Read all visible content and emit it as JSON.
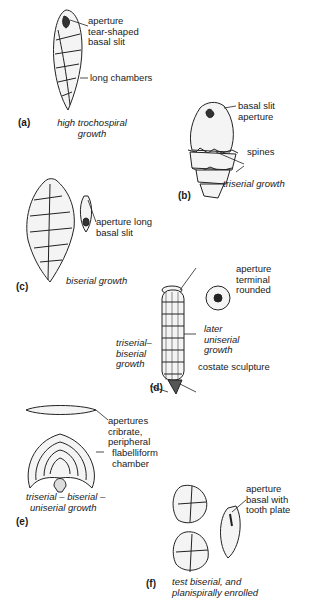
{
  "figure": {
    "panels": [
      {
        "id": "a",
        "tag": "(a)",
        "caption": [
          "high trochospiral",
          "growth"
        ],
        "labels": [
          [
            "aperture",
            "tear-shaped",
            "basal slit"
          ],
          [
            "long chambers"
          ]
        ]
      },
      {
        "id": "b",
        "tag": "(b)",
        "caption": [
          "triserial growth"
        ],
        "labels": [
          [
            "basal slit",
            "aperture"
          ],
          [
            "spines"
          ]
        ]
      },
      {
        "id": "c",
        "tag": "(c)",
        "caption": [
          "biserial growth"
        ],
        "labels": [
          [
            "aperture long",
            "basal slit"
          ]
        ]
      },
      {
        "id": "d",
        "tag": "(d)",
        "caption": [
          "triserial–",
          "biserial",
          "growth"
        ],
        "labels": [
          [
            "aperture",
            "terminal",
            "rounded"
          ],
          [
            "later",
            "uniserial",
            "growth"
          ],
          [
            "costate sculpture"
          ]
        ]
      },
      {
        "id": "e",
        "tag": "(e)",
        "caption": [
          "triserial – biserial –",
          "uniserial growth"
        ],
        "labels": [
          [
            "apertures",
            "cribrate,",
            "peripheral"
          ],
          [
            "flabelliform",
            "chamber"
          ]
        ]
      },
      {
        "id": "f",
        "tag": "(f)",
        "caption": [
          "test biserial, and",
          "planispirally enrolled"
        ],
        "labels": [
          [
            "aperture",
            "basal with",
            "tooth plate"
          ]
        ]
      }
    ]
  }
}
